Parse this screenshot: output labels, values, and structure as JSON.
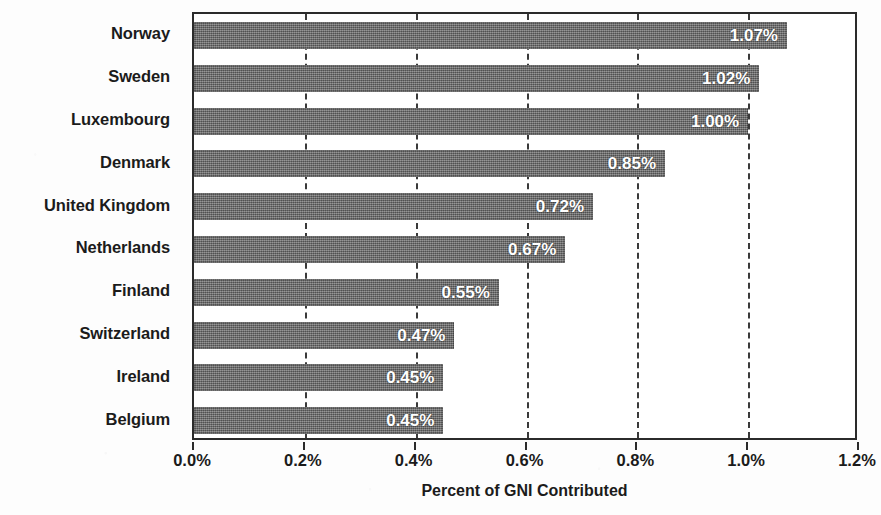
{
  "chart_data": {
    "type": "bar",
    "orientation": "horizontal",
    "title": "",
    "xlabel": "Percent of GNI Contributed",
    "ylabel": "",
    "xlim": [
      0.0,
      1.2
    ],
    "xtick_labels": [
      "0.0%",
      "0.2%",
      "0.4%",
      "0.6%",
      "0.8%",
      "1.0%",
      "1.2%"
    ],
    "xtick_values": [
      0.0,
      0.2,
      0.4,
      0.6,
      0.8,
      1.0,
      1.2
    ],
    "grid": "vertical-dashed",
    "legend": "none",
    "bar_color": "#6e6e6e",
    "value_label_color": "#ffffff",
    "categories": [
      "Norway",
      "Sweden",
      "Luxembourg",
      "Denmark",
      "United Kingdom",
      "Netherlands",
      "Finland",
      "Switzerland",
      "Ireland",
      "Belgium"
    ],
    "values": [
      1.07,
      1.02,
      1.0,
      0.85,
      0.72,
      0.67,
      0.55,
      0.47,
      0.45,
      0.45
    ],
    "value_labels": [
      "1.07%",
      "1.02%",
      "1.00%",
      "0.85%",
      "0.72%",
      "0.67%",
      "0.55%",
      "0.47%",
      "0.45%",
      "0.45%"
    ]
  }
}
